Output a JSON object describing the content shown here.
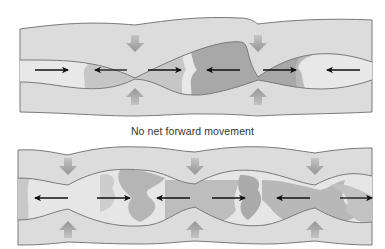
{
  "figure": {
    "caption": "No net forward movement",
    "colors": {
      "wall_fill": "#dcdcdc",
      "wall_line": "#7a7a7a",
      "lumen_light": "#e6e6e6",
      "lumen_medium": "#c4c4c4",
      "lumen_dark": "#a9a9a9",
      "contraction_arrow": "#a0a0a0",
      "flow_arrow": "#111111"
    },
    "panels": [
      {
        "name": "top-segmentation-panel",
        "constrictions_x": [
          135,
          258
        ],
        "flow_arrows": [
          {
            "direction": "right",
            "x1": 35,
            "x2": 68,
            "y": 70
          },
          {
            "direction": "left",
            "x1": 127,
            "x2": 95,
            "y": 70
          },
          {
            "direction": "right",
            "x1": 148,
            "x2": 181,
            "y": 70
          },
          {
            "direction": "left",
            "x1": 240,
            "x2": 207,
            "y": 70
          },
          {
            "direction": "right",
            "x1": 263,
            "x2": 296,
            "y": 70
          },
          {
            "direction": "left",
            "x1": 360,
            "x2": 327,
            "y": 70
          }
        ],
        "contraction_arrows_x": [
          135,
          258
        ]
      },
      {
        "name": "bottom-segmentation-panel",
        "constrictions_x": [
          68,
          195,
          315
        ],
        "flow_arrows": [
          {
            "direction": "left",
            "x1": 68,
            "x2": 35,
            "y": 198
          },
          {
            "direction": "right",
            "x1": 97,
            "x2": 130,
            "y": 198
          },
          {
            "direction": "left",
            "x1": 190,
            "x2": 157,
            "y": 198
          },
          {
            "direction": "right",
            "x1": 212,
            "x2": 245,
            "y": 198
          },
          {
            "direction": "left",
            "x1": 310,
            "x2": 277,
            "y": 198
          },
          {
            "direction": "right",
            "x1": 340,
            "x2": 372,
            "y": 198
          }
        ],
        "contraction_arrows_x": [
          68,
          195,
          315
        ]
      }
    ]
  }
}
